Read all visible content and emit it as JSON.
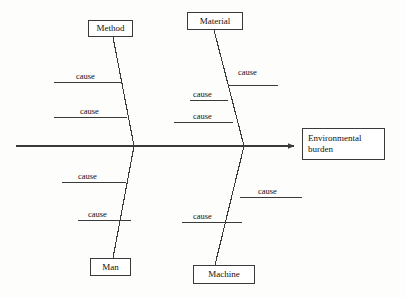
{
  "diagram": {
    "type": "fishbone-ishikawa",
    "title": "",
    "effect": {
      "label": "Environmental burden",
      "line1": "Environmental",
      "line2": "burden"
    },
    "spine": {
      "color": "#3a3a3a",
      "start_x": 16,
      "end_x": 300,
      "y": 146,
      "has_arrow": true
    },
    "categories": [
      {
        "name": "Method",
        "position": "top-left",
        "label": "Method",
        "box": {
          "x": 88,
          "y": 20,
          "w": 45,
          "h": 17
        },
        "bone": {
          "x1": 113,
          "y1": 37,
          "x2": 134,
          "y2": 146
        },
        "causes": [
          {
            "label": "cause",
            "side": "left",
            "line_y": 82,
            "line_x1": 54,
            "line_x2": 121,
            "text_x": 76,
            "text_y": 71
          },
          {
            "label": "cause",
            "side": "left",
            "line_y": 117,
            "line_x1": 54,
            "line_x2": 127,
            "text_x": 80,
            "text_y": 106
          }
        ]
      },
      {
        "name": "Material",
        "position": "top-right",
        "label": "Material",
        "box": {
          "x": 187,
          "y": 12,
          "w": 56,
          "h": 18
        },
        "bone": {
          "x1": 214,
          "y1": 30,
          "x2": 244,
          "y2": 146
        },
        "causes": [
          {
            "label": "cause",
            "side": "right",
            "line_y": 85,
            "line_x1": 228,
            "line_x2": 278,
            "text_x": 238,
            "text_y": 67
          },
          {
            "label": "cause",
            "side": "left",
            "line_y": 100,
            "line_x1": 190,
            "line_x2": 228,
            "text_x": 193,
            "text_y": 89
          },
          {
            "label": "cause",
            "side": "left",
            "line_y": 122,
            "line_x1": 174,
            "line_x2": 233,
            "text_x": 193,
            "text_y": 111
          }
        ]
      },
      {
        "name": "Man",
        "position": "bottom-left",
        "label": "Man",
        "box": {
          "x": 90,
          "y": 258,
          "w": 41,
          "h": 18
        },
        "bone": {
          "x1": 134,
          "y1": 146,
          "x2": 113,
          "y2": 258
        },
        "causes": [
          {
            "label": "cause",
            "side": "left",
            "line_y": 182,
            "line_x1": 62,
            "line_x2": 126,
            "text_x": 78,
            "text_y": 171
          },
          {
            "label": "cause",
            "side": "left",
            "line_y": 220,
            "line_x1": 78,
            "line_x2": 131,
            "text_x": 88,
            "text_y": 209
          }
        ]
      },
      {
        "name": "Machine",
        "position": "bottom-right",
        "label": "Machine",
        "box": {
          "x": 193,
          "y": 265,
          "w": 62,
          "h": 19
        },
        "bone": {
          "x1": 244,
          "y1": 146,
          "x2": 215,
          "y2": 265
        },
        "causes": [
          {
            "label": "cause",
            "side": "right",
            "line_y": 197,
            "line_x1": 240,
            "line_x2": 302,
            "text_x": 258,
            "text_y": 186
          },
          {
            "label": "cause",
            "side": "left",
            "line_y": 222,
            "line_x1": 182,
            "line_x2": 242,
            "text_x": 193,
            "text_y": 211
          }
        ]
      }
    ],
    "colors": {
      "stroke": "#3a3a3a",
      "text": "#111111",
      "background": "#fdfdfc",
      "box_fill": "#ffffff"
    }
  }
}
